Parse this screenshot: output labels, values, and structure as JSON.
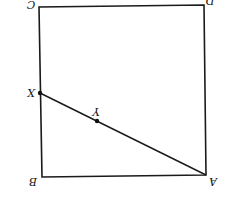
{
  "diagram": {
    "type": "geometry",
    "orientation": "rotated 180 degrees",
    "shape": "square",
    "vertices": {
      "A": {
        "label": "A",
        "x": 206,
        "y": 175
      },
      "B": {
        "label": "B",
        "x": 42,
        "y": 177
      },
      "C": {
        "label": "C",
        "x": 39,
        "y": 7
      },
      "D": {
        "label": "D",
        "x": 204,
        "y": 5
      }
    },
    "points": {
      "X": {
        "label": "X",
        "x": 40,
        "y": 93,
        "on": "side BC"
      },
      "Y": {
        "label": "Y",
        "x": 97,
        "y": 121,
        "on": "segment AX"
      }
    },
    "segments": [
      "AB",
      "BC",
      "CD",
      "DA",
      "AX"
    ],
    "colors": {
      "stroke": "#1a1a1a",
      "background": "#ffffff"
    }
  }
}
